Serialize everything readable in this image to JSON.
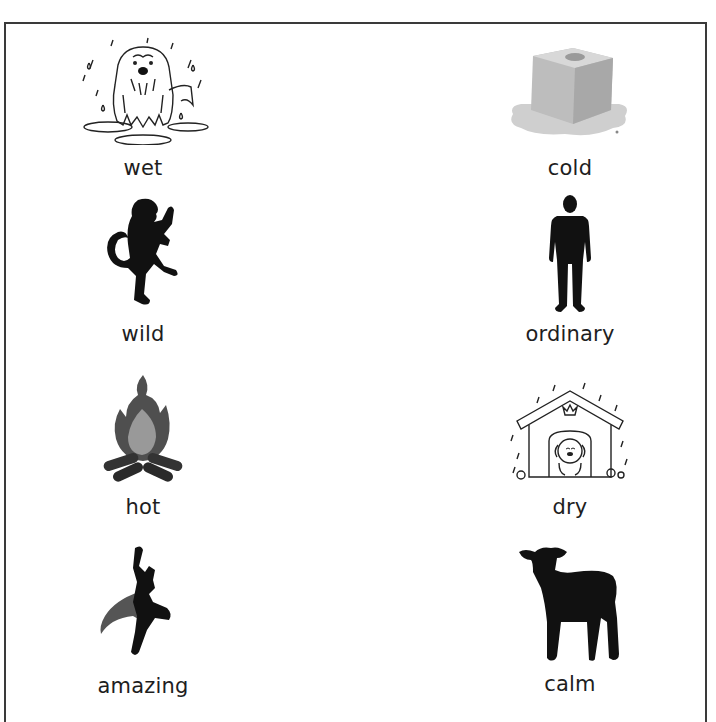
{
  "worksheet": {
    "left_column": [
      {
        "word": "wet",
        "icon": "wet-dog-in-rain-icon"
      },
      {
        "word": "wild",
        "icon": "rampant-lion-icon"
      },
      {
        "word": "hot",
        "icon": "campfire-icon"
      },
      {
        "word": "amazing",
        "icon": "flying-superhero-icon"
      }
    ],
    "right_column": [
      {
        "word": "cold",
        "icon": "melting-ice-cube-icon"
      },
      {
        "word": "ordinary",
        "icon": "standing-man-icon"
      },
      {
        "word": "dry",
        "icon": "dog-in-kennel-icon"
      },
      {
        "word": "calm",
        "icon": "lamb-icon"
      }
    ]
  },
  "colors": {
    "border": "#3a3a3a",
    "text": "#1e1e1e",
    "silhouette": "#111111"
  }
}
